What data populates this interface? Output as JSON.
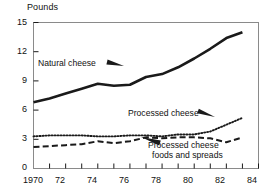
{
  "chart_data": {
    "type": "line",
    "title": "",
    "subtitle": "",
    "xlabel": "",
    "ylabel": "Pounds",
    "ylim": [
      0,
      15
    ],
    "xlim": [
      1970,
      1984
    ],
    "yticks": [
      "0",
      "3",
      "6",
      "9",
      "12",
      "15"
    ],
    "ytick_values": [
      0,
      3,
      6,
      9,
      12,
      15
    ],
    "xticks": [
      "1970",
      "72",
      "74",
      "76",
      "78",
      "80",
      "82",
      "84"
    ],
    "xtick_values": [
      1970,
      1972,
      1974,
      1976,
      1978,
      1980,
      1982,
      1984
    ],
    "xminor_values": [
      1971,
      1973,
      1975,
      1977,
      1979,
      1981,
      1983
    ],
    "grid": false,
    "legend_position": "inline-annotations",
    "x": [
      1970,
      1971,
      1972,
      1973,
      1974,
      1975,
      1976,
      1977,
      1978,
      1979,
      1980,
      1981,
      1982,
      1983
    ],
    "series": [
      {
        "name": "Natural cheese",
        "style": "solid",
        "color": "#1a1a1a",
        "values": [
          6.8,
          7.2,
          7.7,
          8.2,
          8.7,
          8.5,
          8.6,
          9.4,
          9.7,
          10.4,
          11.3,
          12.3,
          13.4,
          14.0
        ]
      },
      {
        "name": "Processed cheese",
        "style": "dotted",
        "color": "#1a1a1a",
        "values": [
          3.3,
          3.4,
          3.4,
          3.4,
          3.3,
          3.3,
          3.4,
          3.4,
          3.3,
          3.5,
          3.5,
          3.8,
          4.5,
          5.2
        ]
      },
      {
        "name": "Processed cheese foods and spreads",
        "style": "dashed",
        "color": "#1a1a1a",
        "values": [
          2.2,
          2.3,
          2.4,
          2.5,
          2.8,
          2.6,
          2.8,
          3.2,
          3.1,
          3.2,
          3.2,
          3.1,
          2.7,
          3.2
        ]
      }
    ],
    "annotations": [
      {
        "text": "Natural cheese",
        "pointer": "arrow-right"
      },
      {
        "text": "Processed cheese",
        "pointer": "arrow-right"
      },
      {
        "text": "Processed cheese foods and spreads",
        "pointer": "arrow-left"
      }
    ]
  },
  "axes": {
    "y_title": "Pounds",
    "y_labels": {
      "t0": "0",
      "t3": "3",
      "t6": "6",
      "t9": "9",
      "t12": "12",
      "t15": "15"
    },
    "x_labels": {
      "x1970": "1970",
      "x1972": "72",
      "x1974": "74",
      "x1976": "76",
      "x1978": "78",
      "x1980": "80",
      "x1982": "82",
      "x1984": "84"
    }
  },
  "labels": {
    "natural_cheese": "Natural cheese",
    "processed_cheese": "Processed cheese",
    "processed_foods_line1": "Processed cheese",
    "processed_foods_line2": "foods and spreads"
  },
  "colors": {
    "ink": "#1a1a1a",
    "frame": "#8a8a8a",
    "background": "#ffffff"
  }
}
